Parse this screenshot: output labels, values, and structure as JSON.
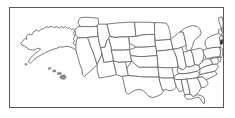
{
  "figure": {
    "frame_color": "#595959",
    "background_color": "#ffffff",
    "boundary_color": "#6b6b6b",
    "highlight_color": "#3a3a3a"
  },
  "map": {
    "projection_label": "",
    "region_name": "United States",
    "insets": [
      {
        "name": "alaska-inset",
        "label": "Alaska"
      },
      {
        "name": "hawaii-inset",
        "label": "Hawaii"
      }
    ],
    "highlighted_regions": [
      "Connecticut",
      "Rhode Island"
    ],
    "states": [
      {
        "code": "WA",
        "name": "Washington"
      },
      {
        "code": "OR",
        "name": "Oregon"
      },
      {
        "code": "CA",
        "name": "California"
      },
      {
        "code": "NV",
        "name": "Nevada"
      },
      {
        "code": "ID",
        "name": "Idaho"
      },
      {
        "code": "MT",
        "name": "Montana"
      },
      {
        "code": "WY",
        "name": "Wyoming"
      },
      {
        "code": "UT",
        "name": "Utah"
      },
      {
        "code": "AZ",
        "name": "Arizona"
      },
      {
        "code": "NM",
        "name": "New Mexico"
      },
      {
        "code": "CO",
        "name": "Colorado"
      },
      {
        "code": "ND",
        "name": "North Dakota"
      },
      {
        "code": "SD",
        "name": "South Dakota"
      },
      {
        "code": "NE",
        "name": "Nebraska"
      },
      {
        "code": "KS",
        "name": "Kansas"
      },
      {
        "code": "OK",
        "name": "Oklahoma"
      },
      {
        "code": "TX",
        "name": "Texas"
      },
      {
        "code": "MN",
        "name": "Minnesota"
      },
      {
        "code": "IA",
        "name": "Iowa"
      },
      {
        "code": "MO",
        "name": "Missouri"
      },
      {
        "code": "AR",
        "name": "Arkansas"
      },
      {
        "code": "LA",
        "name": "Louisiana"
      },
      {
        "code": "WI",
        "name": "Wisconsin"
      },
      {
        "code": "IL",
        "name": "Illinois"
      },
      {
        "code": "MI",
        "name": "Michigan"
      },
      {
        "code": "IN",
        "name": "Indiana"
      },
      {
        "code": "OH",
        "name": "Ohio"
      },
      {
        "code": "KY",
        "name": "Kentucky"
      },
      {
        "code": "TN",
        "name": "Tennessee"
      },
      {
        "code": "MS",
        "name": "Mississippi"
      },
      {
        "code": "AL",
        "name": "Alabama"
      },
      {
        "code": "GA",
        "name": "Georgia"
      },
      {
        "code": "FL",
        "name": "Florida"
      },
      {
        "code": "SC",
        "name": "South Carolina"
      },
      {
        "code": "NC",
        "name": "North Carolina"
      },
      {
        "code": "VA",
        "name": "Virginia"
      },
      {
        "code": "WV",
        "name": "West Virginia"
      },
      {
        "code": "MD",
        "name": "Maryland"
      },
      {
        "code": "DE",
        "name": "Delaware"
      },
      {
        "code": "PA",
        "name": "Pennsylvania"
      },
      {
        "code": "NJ",
        "name": "New Jersey"
      },
      {
        "code": "NY",
        "name": "New York"
      },
      {
        "code": "CT",
        "name": "Connecticut"
      },
      {
        "code": "RI",
        "name": "Rhode Island"
      },
      {
        "code": "MA",
        "name": "Massachusetts"
      },
      {
        "code": "VT",
        "name": "Vermont"
      },
      {
        "code": "NH",
        "name": "New Hampshire"
      },
      {
        "code": "ME",
        "name": "Maine"
      },
      {
        "code": "AK",
        "name": "Alaska"
      },
      {
        "code": "HI",
        "name": "Hawaii"
      }
    ]
  }
}
